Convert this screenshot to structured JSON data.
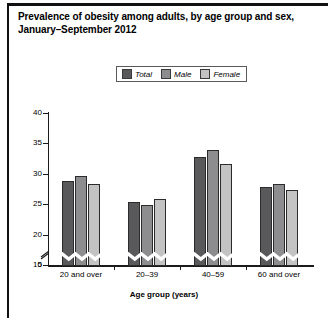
{
  "figure": {
    "title": "Prevalence of obesity among adults, by age group and sex,\nJanuary–September 2012",
    "caption_clipped": "",
    "frame_color": "#111111"
  },
  "legend": {
    "items": [
      {
        "label": "Total",
        "color": "#59595b"
      },
      {
        "label": "Male",
        "color": "#8d8d8f"
      },
      {
        "label": "Female",
        "color": "#c3c3c4"
      }
    ]
  },
  "chart_data": {
    "type": "bar",
    "title": "Prevalence of obesity among adults, by age group and sex, January–September 2012",
    "xlabel": "Age group (years)",
    "ylabel": "Percent",
    "categories": [
      "20 and over",
      "20–39",
      "40–59",
      "60 and over"
    ],
    "series": [
      {
        "name": "Total",
        "color": "#59595b",
        "values": [
          28.9,
          25.5,
          32.9,
          27.9
        ]
      },
      {
        "name": "Male",
        "color": "#8d8d8f",
        "values": [
          29.7,
          25.0,
          34.1,
          28.5
        ]
      },
      {
        "name": "Female",
        "color": "#c3c3c4",
        "values": [
          28.4,
          26.0,
          31.7,
          27.4
        ]
      }
    ],
    "ylim": [
      15,
      40
    ],
    "yticks": [
      0,
      15,
      20,
      25,
      30,
      35,
      40
    ],
    "ytick_labels": [
      "0",
      "15",
      "20",
      "25",
      "30",
      "35",
      "40"
    ],
    "axis_break": true,
    "axis_break_between": [
      0,
      15
    ],
    "grid": false,
    "legend_position": "top-center"
  }
}
